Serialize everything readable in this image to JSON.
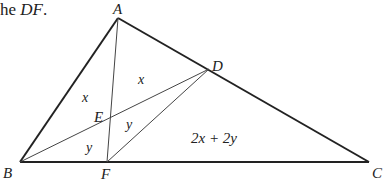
{
  "caption": {
    "prefix": "he ",
    "segment": "DF",
    "suffix": "."
  },
  "points": {
    "A": {
      "label": "A",
      "x": 118,
      "y": 18
    },
    "B": {
      "label": "B",
      "x": 20,
      "y": 162
    },
    "C": {
      "label": "C",
      "x": 369,
      "y": 162
    },
    "D": {
      "label": "D",
      "x": 209,
      "y": 69
    },
    "E": {
      "label": "E",
      "x": 110,
      "y": 117
    },
    "F": {
      "label": "F",
      "x": 107,
      "y": 162
    }
  },
  "region_labels": {
    "x_left": "x",
    "x_upper": "x",
    "y_middle": "y",
    "y_lower": "y",
    "big": "2x + 2y"
  }
}
